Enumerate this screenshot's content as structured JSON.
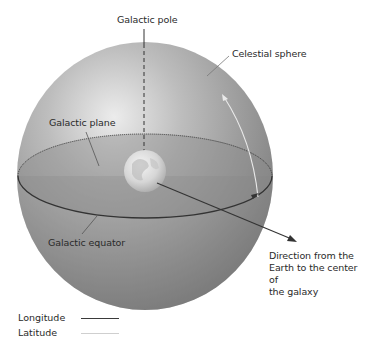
{
  "labels": {
    "galactic_pole": "Galactic pole",
    "celestial_sphere": "Celestial sphere",
    "galactic_plane": "Galactic plane",
    "galactic_equator": "Galactic equator",
    "direction": [
      "Direction from the",
      "Earth to the center of",
      "the galaxy"
    ]
  },
  "legend": [
    {
      "label": "Longitude",
      "color": "#3a3a3a"
    },
    {
      "label": "Latitude",
      "color": "#cfcfcf"
    }
  ],
  "colors": {
    "sphere_light": "#e6e6e6",
    "sphere_mid": "#a8a8a8",
    "sphere_dark": "#7a7a7a",
    "plane_fill": "#8c8c8c",
    "equator_line": "#333333",
    "latitude_arc": "#e8e8e8"
  }
}
